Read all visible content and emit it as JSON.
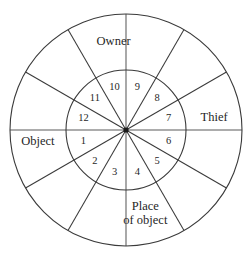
{
  "diagram": {
    "type": "radial-wheel",
    "geometry": {
      "center_x": 126,
      "center_y": 130,
      "outer_radius": 116,
      "inner_radius": 60,
      "sector_count": 12,
      "sector_degrees": 30
    },
    "colors": {
      "stroke": "#3a3a3a",
      "axis_stroke": "#5a5a5a",
      "text": "#1f1f1f",
      "background": "#ffffff"
    },
    "inner_ring": {
      "name": "house-numbers",
      "items": [
        {
          "label": "1",
          "angle_deg": 195,
          "radius": 44
        },
        {
          "label": "2",
          "angle_deg": 225,
          "radius": 44
        },
        {
          "label": "3",
          "angle_deg": 255,
          "radius": 44
        },
        {
          "label": "4",
          "angle_deg": 285,
          "radius": 44
        },
        {
          "label": "5",
          "angle_deg": 315,
          "radius": 44
        },
        {
          "label": "6",
          "angle_deg": 345,
          "radius": 44
        },
        {
          "label": "7",
          "angle_deg": 15,
          "radius": 44
        },
        {
          "label": "8",
          "angle_deg": 45,
          "radius": 44
        },
        {
          "label": "9",
          "angle_deg": 75,
          "radius": 44
        },
        {
          "label": "10",
          "angle_deg": 105,
          "radius": 44
        },
        {
          "label": "11",
          "angle_deg": 135,
          "radius": 44
        },
        {
          "label": "12",
          "angle_deg": 165,
          "radius": 44
        }
      ]
    },
    "outer_ring": {
      "name": "role-labels",
      "items": [
        {
          "id": "owner",
          "lines": [
            "Owner"
          ],
          "angle_deg": 98,
          "radius": 89
        },
        {
          "id": "thief",
          "lines": [
            "Thief"
          ],
          "angle_deg": 8,
          "radius": 89
        },
        {
          "id": "object",
          "lines": [
            "Object"
          ],
          "angle_deg": 188,
          "radius": 89
        },
        {
          "id": "place-of-object",
          "lines": [
            "Place",
            "of object"
          ],
          "angle_deg": 283,
          "radius": 86
        }
      ]
    },
    "spokes": {
      "name": "sector-dividers",
      "angles_deg": [
        0,
        30,
        60,
        90,
        120,
        150,
        180,
        210,
        240,
        270,
        300,
        330
      ],
      "axis_angles_deg": [
        0,
        90,
        180,
        270
      ]
    }
  }
}
